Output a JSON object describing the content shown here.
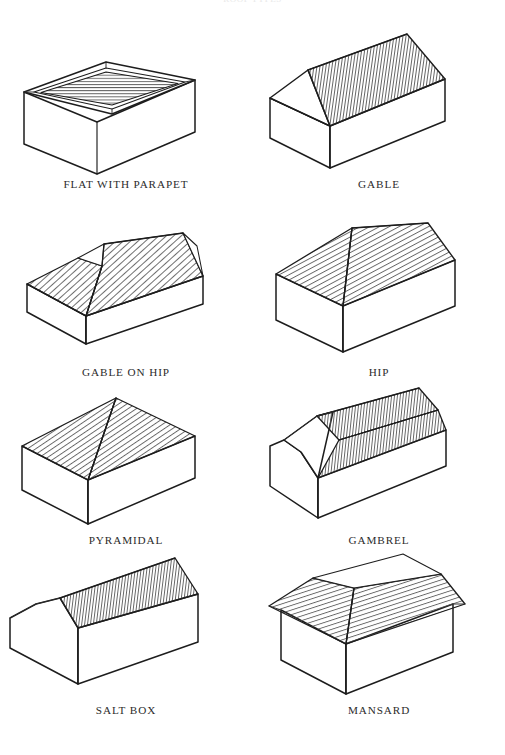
{
  "plate": {
    "title": "ROOF TYPES",
    "domain": "architectural-reference-diagram",
    "page_background": "#ffffff",
    "ink_color": "#1d1d1d",
    "hatch_color": "#4a4a4a",
    "caption_color": "#2b2b2b",
    "columns": 2,
    "rows": 4,
    "total_figures": 8
  },
  "figures": [
    {
      "id": "flat-with-parapet",
      "label": "FLAT WITH PARAPET",
      "row": 1,
      "column": "left",
      "hatch_direction": "horizontal",
      "description": "Low rectangular box with a raised parapet wall surrounding a recessed flat roof deck"
    },
    {
      "id": "gable",
      "label": "GABLE",
      "row": 1,
      "column": "right",
      "hatch_direction": "vertical",
      "description": "Two sloping planes meeting at a central ridge with triangular gable end walls"
    },
    {
      "id": "gable-on-hip",
      "label": "GABLE ON HIP",
      "row": 2,
      "column": "left",
      "hatch_direction": "diagonal",
      "description": "Hipped roof with a small gable set above the hip at the ridge end"
    },
    {
      "id": "hip",
      "label": "HIP",
      "row": 2,
      "column": "right",
      "hatch_direction": "diagonal",
      "description": "Four sloping planes rising from all four walls to a short central ridge"
    },
    {
      "id": "pyramidal",
      "label": "PYRAMIDAL",
      "row": 3,
      "column": "left",
      "hatch_direction": "diagonal",
      "description": "Four triangular planes converging at a single apex point"
    },
    {
      "id": "gambrel",
      "label": "GAMBREL",
      "row": 3,
      "column": "right",
      "hatch_direction": "vertical",
      "description": "Symmetrical barn roof with two slopes per side, shallow above and steep below"
    },
    {
      "id": "salt-box",
      "label": "SALT BOX",
      "row": 4,
      "column": "left",
      "hatch_direction": "vertical",
      "description": "Asymmetric gable with a short front slope and a long rear slope reaching low"
    },
    {
      "id": "mansard",
      "label": "MANSARD",
      "row": 4,
      "column": "right",
      "hatch_direction": "diagonal",
      "description": "Steep hatched lower slopes on all four sides capped by a flat unhatched deck"
    }
  ]
}
